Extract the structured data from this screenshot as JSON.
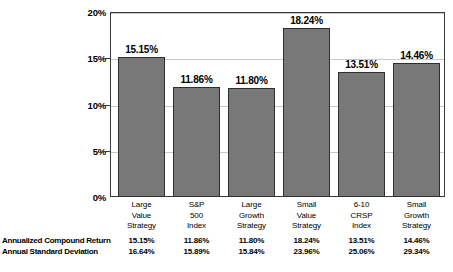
{
  "chart_data": {
    "type": "bar",
    "title": "",
    "subtitle": "",
    "xlabel": "",
    "ylabel": "",
    "ylim": [
      0,
      20
    ],
    "ytick_values": [
      0,
      5,
      10,
      15,
      20
    ],
    "ytick_labels": [
      "0%",
      "5%",
      "10%",
      "15%",
      "20%"
    ],
    "grid": true,
    "grid_axis": "y",
    "legend": false,
    "legend_position": "none",
    "categories": [
      "Large Value Strategy",
      "S&P 500 Index",
      "Large Growth Strategy",
      "Small Value Strategy",
      "6-10 CRSP Index",
      "Small Growth Strategy"
    ],
    "category_lines": [
      [
        "Large",
        "Value",
        "Strategy"
      ],
      [
        "S&P",
        "500",
        "Index"
      ],
      [
        "Large",
        "Growth",
        "Strategy"
      ],
      [
        "Small",
        "Value",
        "Strategy"
      ],
      [
        "6-10",
        "CRSP",
        "Index"
      ],
      [
        "Small",
        "Growth",
        "Strategy"
      ]
    ],
    "values": [
      15.15,
      11.86,
      11.8,
      18.24,
      13.51,
      14.46
    ],
    "value_labels": [
      "15.15%",
      "11.86%",
      "11.80%",
      "18.24%",
      "13.51%",
      "14.46%"
    ],
    "series": [
      {
        "name": "Annualized Compound Return",
        "values": [
          15.15,
          11.86,
          11.8,
          18.24,
          13.51,
          14.46
        ]
      }
    ],
    "bar_color": "#787878",
    "bar_edge_color": "#2e2e2e",
    "grid_color": "#c9c9c9",
    "frame_color": "#3a3a3a"
  },
  "data_table": {
    "rows": [
      {
        "label": "Annualized Compound Return",
        "cells": [
          "15.15%",
          "11.86%",
          "11.80%",
          "18.24%",
          "13.51%",
          "14.46%"
        ]
      },
      {
        "label": "Annual Standard Deviation",
        "cells": [
          "16.64%",
          "15.89%",
          "15.84%",
          "23.96%",
          "25.06%",
          "29.34%"
        ]
      }
    ]
  }
}
